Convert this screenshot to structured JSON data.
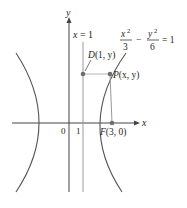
{
  "figure": {
    "type": "hyperbola-focus-directrix",
    "equation": {
      "lhs_num1": "x",
      "lhs_den1": "3",
      "minus": "−",
      "lhs_num2": "y",
      "lhs_den2": "6",
      "exp": "2",
      "rhs": "= 1"
    },
    "axes": {
      "x_label": "x",
      "y_label": "y",
      "origin_label": "0",
      "tick_1_label": "1"
    },
    "directrix": {
      "label": "x = 1",
      "label_x": "x",
      "label_rest": " = 1"
    },
    "points": {
      "D": {
        "name": "D",
        "coords": "(1, y)"
      },
      "P": {
        "name": "P",
        "coords": "(x, y)"
      },
      "F": {
        "name": "F",
        "coords": "(3, 0)"
      }
    },
    "colors": {
      "curve": "#555555",
      "axis": "#333333",
      "point": "#6d6e70",
      "guide": "#9a9a9a"
    }
  }
}
